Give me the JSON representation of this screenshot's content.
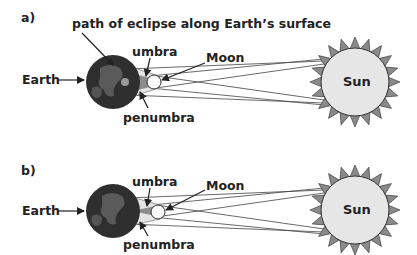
{
  "panels": [
    {
      "label": "a)",
      "labels": {
        "path": "path of eclipse along Earth’s surface",
        "umbra": "umbra",
        "moon": "Moon",
        "earth": "Earth",
        "penumbra": "penumbra",
        "sun": "Sun"
      }
    },
    {
      "label": "b)",
      "labels": {
        "umbra": "umbra",
        "moon": "Moon",
        "earth": "Earth",
        "penumbra": "penumbra",
        "sun": "Sun"
      }
    }
  ],
  "colors": {
    "earth": "#2f2f2f",
    "land": "#5a5a5a",
    "sun_disk": "#e6e6e6",
    "sun_rays": "#8a8a8a",
    "umbra": "#8c8c8c",
    "penumbra": "#e4e4e4",
    "lines": "#444444"
  }
}
